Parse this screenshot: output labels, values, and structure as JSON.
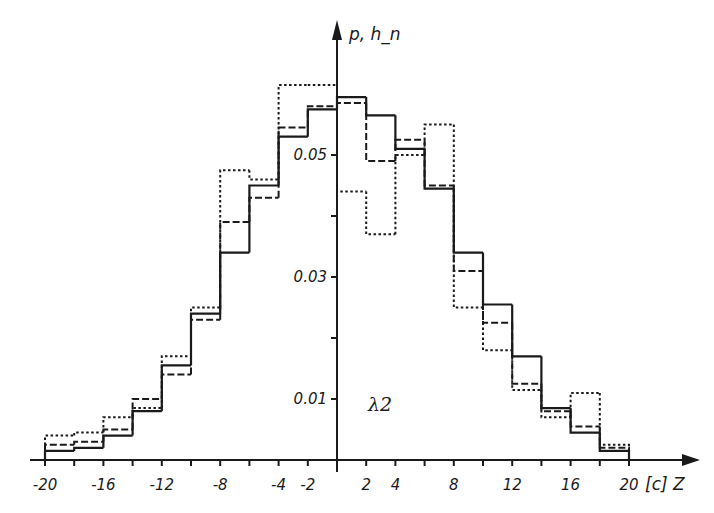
{
  "chart_data": {
    "type": "bar",
    "subtype": "step-histogram-overlay",
    "title": "",
    "xlabel": "[c] Z",
    "ylabel": "p, h_n",
    "annotation": "λ2",
    "xlim": [
      -20,
      20
    ],
    "ylim": [
      0,
      0.06
    ],
    "grid": false,
    "legend": "none",
    "x_tick_labels": [
      "-20",
      "-16",
      "-12",
      "-8",
      "-4",
      "-2",
      "2",
      "4",
      "8",
      "12",
      "16",
      "20"
    ],
    "x_tick_values": [
      -20,
      -16,
      -12,
      -8,
      -4,
      -2,
      2,
      4,
      8,
      12,
      16,
      20
    ],
    "x_minor_ticks": [
      -20,
      -18,
      -16,
      -14,
      -12,
      -10,
      -8,
      -6,
      -4,
      -2,
      0,
      2,
      4,
      6,
      8,
      10,
      12,
      14,
      16,
      18,
      20
    ],
    "y_tick_labels": [
      "0.01",
      "0.03",
      "0.05"
    ],
    "y_tick_values": [
      0.01,
      0.03,
      0.05
    ],
    "y_minor_ticks": [
      0.02,
      0.04
    ],
    "bin_edges": [
      -20,
      -18,
      -16,
      -14,
      -12,
      -10,
      -8,
      -6,
      -4,
      -2,
      0,
      2,
      4,
      6,
      8,
      10,
      12,
      14,
      16,
      18,
      20
    ],
    "series": [
      {
        "name": "p (solid)",
        "style": "solid",
        "values": [
          0.0015,
          0.002,
          0.004,
          0.008,
          0.0155,
          0.024,
          0.034,
          0.045,
          0.053,
          0.0575,
          0.0595,
          0.0565,
          0.051,
          0.0445,
          0.034,
          0.0255,
          0.017,
          0.0085,
          0.0045,
          0.0015
        ]
      },
      {
        "name": "h_n (dashed)",
        "style": "dashed",
        "values": [
          0.0025,
          0.003,
          0.005,
          0.01,
          0.014,
          0.023,
          0.039,
          0.043,
          0.0545,
          0.058,
          0.0585,
          0.049,
          0.0525,
          0.045,
          0.031,
          0.0225,
          0.0125,
          0.008,
          0.0055,
          0.002
        ]
      },
      {
        "name": "h_n (dotted)",
        "style": "dotted",
        "values": [
          0.004,
          0.0045,
          0.007,
          0.0085,
          0.017,
          0.025,
          0.0475,
          0.046,
          0.0615,
          0.0615,
          0.044,
          0.037,
          0.05,
          0.055,
          0.025,
          0.018,
          0.0115,
          0.007,
          0.011,
          0.0025
        ]
      }
    ]
  },
  "geometry": {
    "x_origin_px": 337,
    "x_px_per_unit": 14.6,
    "y_base_px": 460,
    "y_px_per_unit": 6100,
    "x_axis_right_px": 700,
    "y_axis_top_px": 20,
    "x_axis_left_px": 30
  }
}
